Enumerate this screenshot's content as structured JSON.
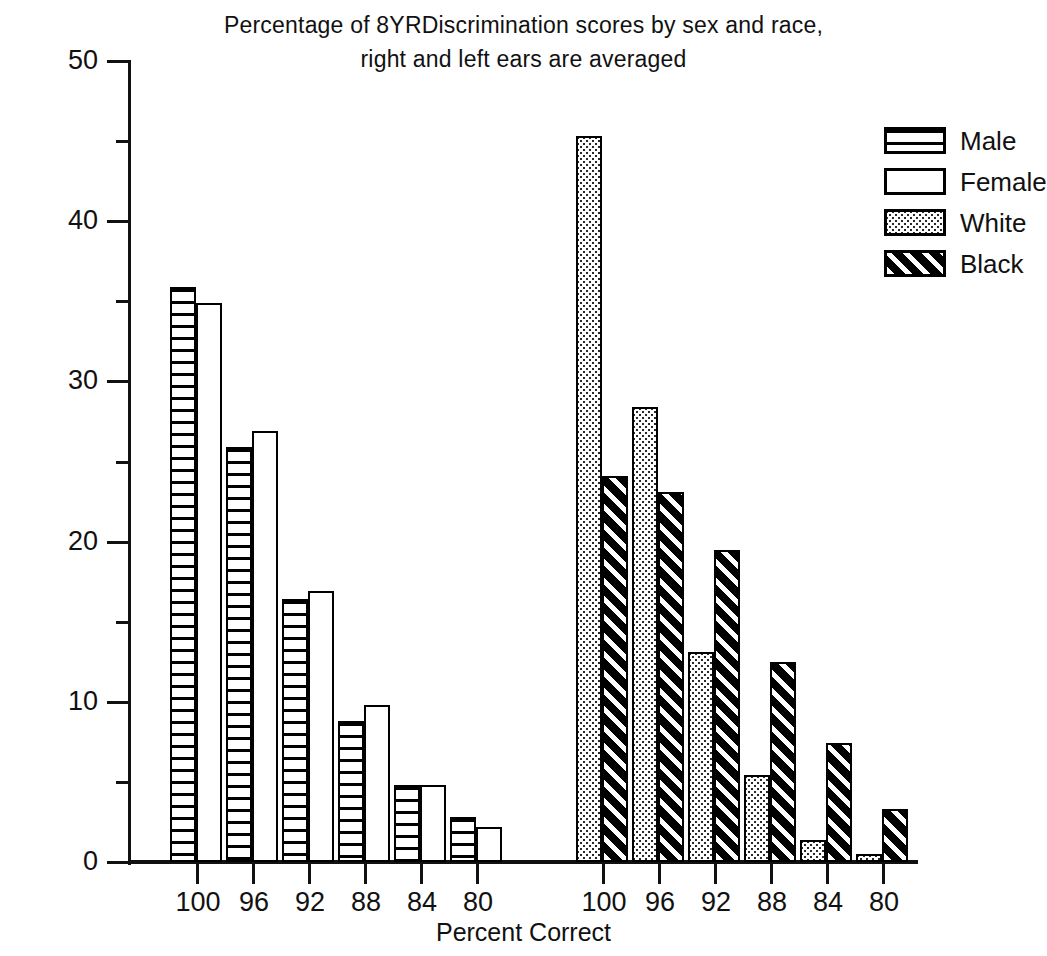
{
  "chart_data": {
    "type": "bar",
    "title": "Percentage of 8YRDiscrimination scores by sex and race,",
    "title_line2": "right and left ears are averaged",
    "xlabel": "Percent Correct",
    "ylabel": "PERCENT OF SAMPLE",
    "ylim": [
      0,
      50
    ],
    "ytick_labels": [
      "0",
      "10",
      "20",
      "30",
      "40",
      "50"
    ],
    "ytick_values": [
      0,
      10,
      20,
      30,
      40,
      50
    ],
    "yminor_values": [
      5,
      15,
      25,
      35,
      45
    ],
    "grid": false,
    "legend_position": "right",
    "legend": [
      {
        "label": "Male",
        "pattern": "horizontal-stripes"
      },
      {
        "label": "Female",
        "pattern": "empty"
      },
      {
        "label": "White",
        "pattern": "dotted"
      },
      {
        "label": "Black",
        "pattern": "diagonal-stripes"
      }
    ],
    "panels": [
      {
        "name": "sex",
        "categories": [
          "100",
          "96",
          "92",
          "88",
          "84",
          "80"
        ],
        "series": [
          {
            "name": "Male",
            "values": [
              35.9,
              25.9,
              16.4,
              8.8,
              4.8,
              2.8
            ]
          },
          {
            "name": "Female",
            "values": [
              34.9,
              26.9,
              16.9,
              9.8,
              4.8,
              2.2
            ]
          }
        ]
      },
      {
        "name": "race",
        "categories": [
          "100",
          "96",
          "92",
          "88",
          "84",
          "80"
        ],
        "series": [
          {
            "name": "White",
            "values": [
              45.3,
              28.4,
              13.1,
              5.4,
              1.4,
              0.5
            ]
          },
          {
            "name": "Black",
            "values": [
              24.1,
              23.1,
              19.5,
              12.5,
              7.4,
              3.3
            ]
          }
        ]
      }
    ]
  }
}
